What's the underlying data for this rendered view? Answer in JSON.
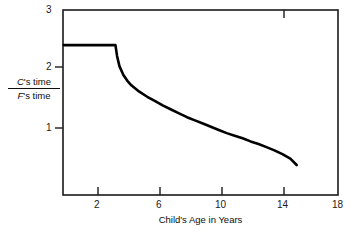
{
  "chart_data": {
    "type": "line",
    "title": "",
    "xlabel": "Child's Age in Years",
    "ylabel_numerator": "C's time",
    "ylabel_denominator": "F's time",
    "ylabel_numerator_italic": "C",
    "ylabel_numerator_rest": "'s time",
    "ylabel_denominator_italic": "F",
    "ylabel_denominator_rest": "'s time",
    "xlim": [
      0.7,
      18
    ],
    "ylim": [
      0.1,
      3
    ],
    "xticks": [
      2,
      6,
      10,
      14,
      18
    ],
    "xtick_labels": [
      "2",
      "6",
      "10",
      "14",
      "18"
    ],
    "yticks": [
      1,
      2,
      3
    ],
    "ytick_labels": [
      "1",
      "2",
      "3"
    ],
    "grid": false,
    "legend": null,
    "frame": "box",
    "series": [
      {
        "name": "C's time / F's time",
        "color": "#000000",
        "linewidth": 2.6,
        "x": [
          0.75,
          1.0,
          1.5,
          2.0,
          2.5,
          3.0,
          3.5,
          3.9,
          4.0,
          4.1,
          4.25,
          4.5,
          4.75,
          5.0,
          5.5,
          6.0,
          6.5,
          7.0,
          7.5,
          8.0,
          8.5,
          9.0,
          9.5,
          10.0,
          10.5,
          11.0,
          11.5,
          12.0,
          12.5,
          13.0,
          13.5,
          14.0,
          14.5,
          15.0,
          15.4
        ],
        "y": [
          2.45,
          2.45,
          2.45,
          2.45,
          2.45,
          2.45,
          2.45,
          2.45,
          2.45,
          2.28,
          2.12,
          1.98,
          1.89,
          1.82,
          1.72,
          1.64,
          1.57,
          1.5,
          1.44,
          1.38,
          1.32,
          1.27,
          1.22,
          1.17,
          1.12,
          1.07,
          1.03,
          0.99,
          0.94,
          0.9,
          0.85,
          0.8,
          0.74,
          0.67,
          0.57
        ]
      }
    ]
  },
  "axes": {
    "left_px": 63,
    "right_px": 338,
    "top_px": 10,
    "bottom_px": 195
  }
}
